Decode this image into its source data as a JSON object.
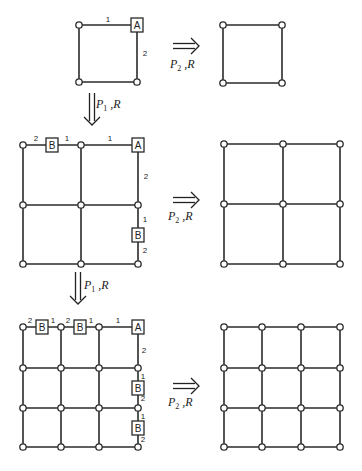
{
  "colors": {
    "line": "#2a2a2a",
    "background": "#ffffff"
  },
  "rules": {
    "horizontal": {
      "P": "P",
      "sub": "2",
      "R": "R"
    },
    "vertical": {
      "P": "P",
      "sub": "1",
      "R": "R"
    }
  },
  "stages": [
    {
      "name": "stage-1",
      "left": {
        "xs": [
          79,
          137
        ],
        "ys": [
          25,
          82
        ],
        "boxes": [
          {
            "label": "A",
            "x": 137,
            "y": 25
          }
        ],
        "weights": [
          {
            "text": "1",
            "x": 108,
            "y": 19
          },
          {
            "text": "2",
            "x": 145,
            "y": 53
          }
        ]
      },
      "right": {
        "xs": [
          223,
          282
        ],
        "ys": [
          25,
          83
        ]
      },
      "h_arrow": {
        "x": 173,
        "y": 46,
        "label_x": 170,
        "label_y": 68
      }
    },
    {
      "name": "stage-2",
      "left": {
        "xs": [
          23,
          81,
          138
        ],
        "ys": [
          145,
          205,
          264
        ],
        "boxes": [
          {
            "label": "B",
            "x": 52,
            "y": 145
          },
          {
            "label": "A",
            "x": 138,
            "y": 145
          },
          {
            "label": "B",
            "x": 138,
            "y": 235
          }
        ],
        "weights": [
          {
            "text": "2",
            "x": 36,
            "y": 138
          },
          {
            "text": "1",
            "x": 67,
            "y": 138
          },
          {
            "text": "1",
            "x": 110,
            "y": 138
          },
          {
            "text": "2",
            "x": 146,
            "y": 176
          },
          {
            "text": "1",
            "x": 145,
            "y": 219
          },
          {
            "text": "2",
            "x": 145,
            "y": 250
          }
        ]
      },
      "right": {
        "xs": [
          224,
          283,
          340
        ],
        "ys": [
          144,
          204,
          264
        ]
      },
      "h_arrow": {
        "x": 173,
        "y": 200,
        "label_x": 168,
        "label_y": 220
      }
    },
    {
      "name": "stage-3",
      "left": {
        "xs": [
          23,
          61,
          99,
          138
        ],
        "ys": [
          327,
          368,
          408,
          447
        ],
        "boxes": [
          {
            "label": "B",
            "x": 42,
            "y": 327
          },
          {
            "label": "B",
            "x": 80,
            "y": 327
          },
          {
            "label": "A",
            "x": 138,
            "y": 327
          },
          {
            "label": "B",
            "x": 138,
            "y": 388
          },
          {
            "label": "B",
            "x": 138,
            "y": 428
          }
        ],
        "weights": [
          {
            "text": "2",
            "x": 30,
            "y": 320
          },
          {
            "text": "1",
            "x": 53,
            "y": 320
          },
          {
            "text": "2",
            "x": 68,
            "y": 320
          },
          {
            "text": "1",
            "x": 91,
            "y": 320
          },
          {
            "text": "1",
            "x": 118,
            "y": 320
          },
          {
            "text": "2",
            "x": 144,
            "y": 350
          },
          {
            "text": "1",
            "x": 143,
            "y": 376
          },
          {
            "text": "2",
            "x": 143,
            "y": 398
          },
          {
            "text": "1",
            "x": 143,
            "y": 416
          },
          {
            "text": "2",
            "x": 143,
            "y": 439
          }
        ]
      },
      "right": {
        "xs": [
          224,
          262,
          301,
          340
        ],
        "ys": [
          327,
          368,
          408,
          447
        ]
      },
      "h_arrow": {
        "x": 173,
        "y": 386,
        "label_x": 168,
        "label_y": 406
      }
    }
  ],
  "v_arrows": [
    {
      "x": 92,
      "y1": 93,
      "y2": 124,
      "label_x": 96,
      "label_y": 108
    },
    {
      "x": 78,
      "y1": 272,
      "y2": 303,
      "label_x": 84,
      "label_y": 289
    }
  ]
}
